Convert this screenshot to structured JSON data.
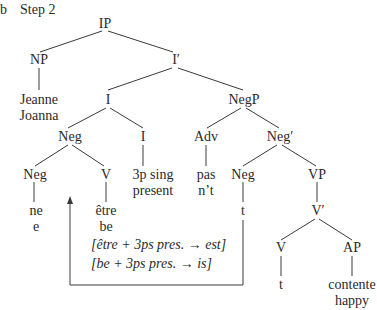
{
  "label": "b",
  "title": "Step 2",
  "nodes": {
    "ip": "IP",
    "np": "NP",
    "i_bar": "I′",
    "np_word_fr": "Jeanne",
    "np_word_en": "Joanna",
    "i_upper": "I",
    "negp": "NegP",
    "neg_complex": "Neg",
    "i_lower": "I",
    "adv": "Adv",
    "neg_bar": "Neg′",
    "neg_ne": "Neg",
    "v_etre": "V",
    "infl_line1": "3p sing",
    "infl_line2": "present",
    "adv_fr": "pas",
    "adv_en": "n’t",
    "neg_trace_label": "Neg",
    "vp": "VP",
    "ne_fr": "ne",
    "ne_en": "e",
    "etre_fr": "être",
    "etre_en": "be",
    "neg_trace": "t",
    "v_bar": "V′",
    "v_lower": "V",
    "ap": "AP",
    "v_trace": "t",
    "ap_fr": "contente",
    "ap_en": "happy"
  },
  "annotations": {
    "fr": "[être + 3ps pres. → est]",
    "en": "[be + 3ps pres. → is]"
  },
  "movement_arrow": {
    "from": "Neg trace t",
    "to": "Neg complex"
  }
}
